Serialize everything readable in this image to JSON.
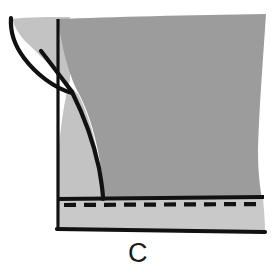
{
  "figure": {
    "caption": "C",
    "title_alt": "Pattern diagram C - garment hem and side seam detail",
    "colors": {
      "background": "#ffffff",
      "body_fill": "#9c9c9c",
      "underlayer_fill": "#c3c3c3",
      "hem_band_fill": "#c9c9c9",
      "ink": "#111111",
      "caption_color": "#1a1a1a"
    },
    "shapes": [
      {
        "name": "main-body-panel",
        "fill": "body_fill",
        "description": "Large mid-gray fabric panel occupying the upper right of the figure"
      },
      {
        "name": "under-panel",
        "fill": "underlayer_fill",
        "description": "Lighter gray panel visible left of the curved seam"
      },
      {
        "name": "hem-band",
        "fill": "hem_band_fill",
        "description": "Lighter horizontal band along the bottom between the hem line and the bottom edge"
      }
    ],
    "lines": [
      {
        "name": "curved-side-seam",
        "style": "solid",
        "width": 4
      },
      {
        "name": "vertical-grain-line",
        "style": "solid",
        "width": 3
      },
      {
        "name": "inner-fold-line",
        "style": "solid",
        "width": 4
      },
      {
        "name": "hem-fold-line",
        "style": "solid",
        "width": 4
      },
      {
        "name": "hem-stitch-line",
        "style": "dashed",
        "width": 4,
        "dash_length": 12,
        "gap_length": 8
      },
      {
        "name": "bottom-edge-line",
        "style": "solid",
        "width": 4
      },
      {
        "name": "left-outer-edge",
        "style": "solid",
        "width": 4
      }
    ]
  }
}
